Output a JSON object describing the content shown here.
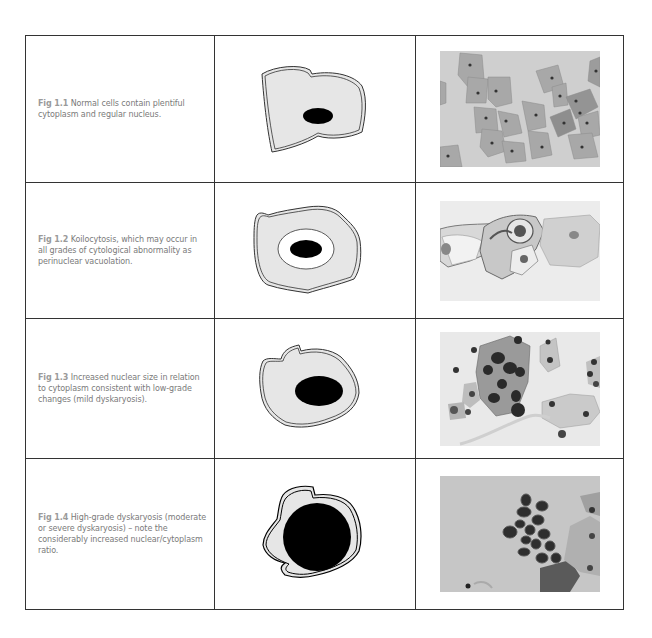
{
  "figures": [
    {
      "label": "Fig 1.1",
      "caption": " Normal cells contain plentiful cytoplasm and regular nucleus.",
      "diagram_icon": "normal-cell-diagram",
      "photo_alt": "normal-cells-micrograph"
    },
    {
      "label": "Fig 1.2",
      "caption": " Koilocytosis, which may occur in all grades of cytological abnormality as perinuclear vacuolation.",
      "diagram_icon": "koilocyte-cell-diagram",
      "photo_alt": "koilocytosis-micrograph"
    },
    {
      "label": "Fig 1.3",
      "caption": " Increased nuclear size in relation to cytoplasm consistent with low-grade changes (mild dyskaryosis).",
      "diagram_icon": "low-grade-cell-diagram",
      "photo_alt": "low-grade-dyskaryosis-micrograph"
    },
    {
      "label": "Fig 1.4",
      "caption": " High-grade dyskaryosis (moderate or severe dyskaryosis) – note the considerably increased nuclear/cytoplasm ratio.",
      "diagram_icon": "high-grade-cell-diagram",
      "photo_alt": "high-grade-dyskaryosis-micrograph"
    }
  ],
  "colors": {
    "cytoplasm": "#e6e6e6",
    "nucleus": "#000000",
    "border": "#333333",
    "caption_text": "#7a7a7a",
    "photo_bg": "#c9c9c9"
  }
}
